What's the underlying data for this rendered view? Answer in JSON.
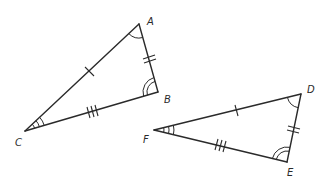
{
  "diagram": {
    "type": "congruent-triangles",
    "triangles": [
      {
        "name": "triangle-ABC",
        "vertices": {
          "A": {
            "label": "A",
            "x": 139,
            "y": 24
          },
          "B": {
            "label": "B",
            "x": 158,
            "y": 92
          },
          "C": {
            "label": "C",
            "x": 25,
            "y": 131
          }
        },
        "side_marks": {
          "CA": 1,
          "AB": 2,
          "CB": 3
        },
        "angle_marks": {
          "A": 1,
          "B": 2,
          "C": 3
        }
      },
      {
        "name": "triangle-DEF",
        "vertices": {
          "D": {
            "label": "D",
            "x": 301,
            "y": 94
          },
          "E": {
            "label": "E",
            "x": 287,
            "y": 162
          },
          "F": {
            "label": "F",
            "x": 154,
            "y": 130
          }
        },
        "side_marks": {
          "FD": 1,
          "DE": 2,
          "FE": 3
        },
        "angle_marks": {
          "D": 1,
          "E": 2,
          "F": 3
        }
      }
    ],
    "labels": {
      "A": "A",
      "B": "B",
      "C": "C",
      "D": "D",
      "E": "E",
      "F": "F"
    },
    "colors": {
      "stroke": "#2a2a2a",
      "background": "#ffffff"
    }
  }
}
